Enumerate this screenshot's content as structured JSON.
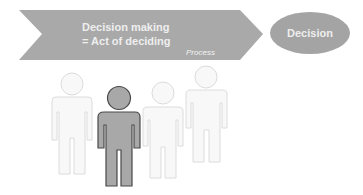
{
  "process_arrow": {
    "line1": "Decision making",
    "line2": "= Act of deciding",
    "caption": "Process",
    "fill": "#a9a9a9"
  },
  "outcome": {
    "label": "Decision",
    "fill": "#a4a4a4"
  },
  "people": {
    "count": 4,
    "highlighted_index": 1,
    "highlight_fill": "#a8a8a8",
    "highlight_stroke": "#4a4a4a",
    "faded_fill": "#f8f8f8",
    "faded_stroke": "#dcdcdc"
  },
  "colors": {
    "text_on_shape": "#eeeeee",
    "background": "#ffffff"
  }
}
